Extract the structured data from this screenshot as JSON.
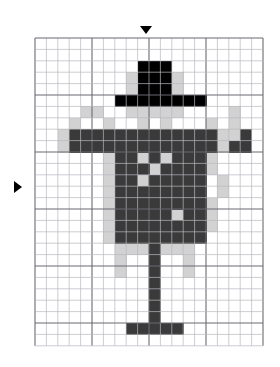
{
  "figure": {
    "kind": "pixel-art-grid-puzzle",
    "subject_label": "scarecrow-figure"
  },
  "grid": {
    "origin_x": 35,
    "origin_y": 38,
    "cell_size": 11.4,
    "columns": 20,
    "rows": 27,
    "minor_line_color": "#b9b9c0",
    "major_line_color": "#6b6b72",
    "major_every": 5,
    "background_color": "#ffffff"
  },
  "palette": {
    "black": "#000000",
    "dark": "#3a3a3a",
    "light": "#d2d2d2",
    "empty": "#ffffff"
  },
  "markers": [
    {
      "name": "column-marker",
      "shape": "triangle-down",
      "x": 140,
      "y": 26,
      "color": "#000000"
    },
    {
      "name": "row-marker",
      "shape": "triangle-right",
      "x": 14,
      "y": 181,
      "color": "#000000"
    }
  ],
  "pixels": {
    "black": [
      [
        2,
        9
      ],
      [
        2,
        10
      ],
      [
        2,
        11
      ],
      [
        3,
        9
      ],
      [
        3,
        10
      ],
      [
        3,
        11
      ],
      [
        4,
        9
      ],
      [
        4,
        10
      ],
      [
        4,
        11
      ],
      [
        5,
        7
      ],
      [
        5,
        8
      ],
      [
        5,
        9
      ],
      [
        5,
        10
      ],
      [
        5,
        11
      ],
      [
        5,
        12
      ],
      [
        5,
        13
      ],
      [
        5,
        14
      ]
    ],
    "dark": [
      [
        8,
        3
      ],
      [
        8,
        4
      ],
      [
        8,
        5
      ],
      [
        8,
        6
      ],
      [
        8,
        7
      ],
      [
        8,
        8
      ],
      [
        8,
        9
      ],
      [
        8,
        10
      ],
      [
        8,
        11
      ],
      [
        8,
        12
      ],
      [
        8,
        13
      ],
      [
        8,
        14
      ],
      [
        8,
        15
      ],
      [
        8,
        18
      ],
      [
        9,
        3
      ],
      [
        9,
        4
      ],
      [
        9,
        5
      ],
      [
        9,
        6
      ],
      [
        9,
        7
      ],
      [
        9,
        8
      ],
      [
        9,
        9
      ],
      [
        9,
        10
      ],
      [
        9,
        11
      ],
      [
        9,
        12
      ],
      [
        9,
        13
      ],
      [
        9,
        14
      ],
      [
        9,
        15
      ],
      [
        9,
        17
      ],
      [
        9,
        18
      ],
      [
        10,
        7
      ],
      [
        10,
        8
      ],
      [
        10,
        10
      ],
      [
        10,
        12
      ],
      [
        10,
        13
      ],
      [
        10,
        14
      ],
      [
        11,
        7
      ],
      [
        11,
        8
      ],
      [
        11,
        9
      ],
      [
        11,
        11
      ],
      [
        11,
        12
      ],
      [
        11,
        13
      ],
      [
        11,
        14
      ],
      [
        12,
        7
      ],
      [
        12,
        8
      ],
      [
        12,
        10
      ],
      [
        12,
        11
      ],
      [
        12,
        12
      ],
      [
        12,
        13
      ],
      [
        12,
        14
      ],
      [
        13,
        7
      ],
      [
        13,
        8
      ],
      [
        13,
        9
      ],
      [
        13,
        10
      ],
      [
        13,
        11
      ],
      [
        13,
        12
      ],
      [
        13,
        13
      ],
      [
        13,
        14
      ],
      [
        14,
        7
      ],
      [
        14,
        8
      ],
      [
        14,
        9
      ],
      [
        14,
        10
      ],
      [
        14,
        11
      ],
      [
        14,
        12
      ],
      [
        14,
        13
      ],
      [
        14,
        14
      ],
      [
        15,
        7
      ],
      [
        15,
        8
      ],
      [
        15,
        9
      ],
      [
        15,
        10
      ],
      [
        15,
        11
      ],
      [
        15,
        13
      ],
      [
        15,
        14
      ],
      [
        16,
        7
      ],
      [
        16,
        8
      ],
      [
        16,
        9
      ],
      [
        16,
        10
      ],
      [
        16,
        11
      ],
      [
        16,
        12
      ],
      [
        16,
        13
      ],
      [
        16,
        14
      ],
      [
        17,
        7
      ],
      [
        17,
        8
      ],
      [
        17,
        9
      ],
      [
        17,
        10
      ],
      [
        17,
        11
      ],
      [
        17,
        12
      ],
      [
        17,
        13
      ],
      [
        17,
        14
      ],
      [
        18,
        10
      ],
      [
        19,
        10
      ],
      [
        20,
        10
      ],
      [
        21,
        10
      ],
      [
        22,
        10
      ],
      [
        23,
        10
      ],
      [
        24,
        10
      ],
      [
        25,
        8
      ],
      [
        25,
        9
      ],
      [
        25,
        10
      ],
      [
        25,
        11
      ],
      [
        25,
        12
      ]
    ],
    "light": [
      [
        3,
        8
      ],
      [
        3,
        12
      ],
      [
        4,
        8
      ],
      [
        4,
        12
      ],
      [
        6,
        8
      ],
      [
        6,
        9
      ],
      [
        6,
        10
      ],
      [
        6,
        11
      ],
      [
        6,
        12
      ],
      [
        6,
        4
      ],
      [
        6,
        5
      ],
      [
        6,
        17
      ],
      [
        7,
        6
      ],
      [
        7,
        9
      ],
      [
        7,
        11
      ],
      [
        7,
        15
      ],
      [
        7,
        17
      ],
      [
        7,
        3
      ],
      [
        8,
        2
      ],
      [
        8,
        16
      ],
      [
        8,
        17
      ],
      [
        9,
        2
      ],
      [
        9,
        16
      ],
      [
        10,
        6
      ],
      [
        10,
        9
      ],
      [
        10,
        11
      ],
      [
        10,
        15
      ],
      [
        11,
        6
      ],
      [
        11,
        10
      ],
      [
        11,
        15
      ],
      [
        12,
        6
      ],
      [
        12,
        9
      ],
      [
        12,
        16
      ],
      [
        13,
        6
      ],
      [
        13,
        16
      ],
      [
        14,
        6
      ],
      [
        14,
        15
      ],
      [
        15,
        6
      ],
      [
        15,
        12
      ],
      [
        15,
        15
      ],
      [
        16,
        6
      ],
      [
        16,
        15
      ],
      [
        17,
        6
      ],
      [
        18,
        7
      ],
      [
        18,
        8
      ],
      [
        18,
        9
      ],
      [
        18,
        11
      ],
      [
        18,
        12
      ],
      [
        18,
        13
      ],
      [
        19,
        7
      ],
      [
        19,
        13
      ],
      [
        20,
        7
      ],
      [
        20,
        13
      ]
    ]
  }
}
